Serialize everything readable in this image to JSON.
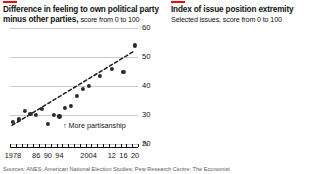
{
  "source": {
    "text": "Sources: ANES; American National Election Studies; Pew Research Centre; The Economist"
  },
  "left": {
    "title": "Difference in feeling to own political party",
    "title_line2": "minus other parties,",
    "subtitle": "score from 0 to 100",
    "annotation": "↑ More partisanship",
    "break_symbol": "∿"
  },
  "right": {
    "title": "Index of issue position extremity",
    "subtitle": "Selected issues, score from 0 to 100",
    "annotation": "↑ More divided beliefs",
    "break_symbol": "∿"
  },
  "chart_data": [
    {
      "type": "scatter",
      "title": "Difference in feeling to own political party minus other parties",
      "subtitle": "score from 0 to 100",
      "xlabel": "",
      "ylabel": "score from 0 to 100",
      "ylim": [
        20,
        60
      ],
      "xlim": [
        1977,
        2021
      ],
      "yticks": [
        20,
        30,
        40,
        50,
        60
      ],
      "xticks": [
        1978,
        1986,
        1990,
        1994,
        2004,
        2012,
        2016,
        2020
      ],
      "xticklabels": [
        "1978",
        "86",
        "90",
        "94",
        "2004",
        "12",
        "16",
        "20"
      ],
      "grid": true,
      "legend": "none",
      "annotation": "↑ More partisanship",
      "x": [
        1978,
        1980,
        1982,
        1984,
        1986,
        1988,
        1990,
        1992,
        1994,
        1996,
        1998,
        2000,
        2002,
        2004,
        2008,
        2012,
        2016,
        2020
      ],
      "values": [
        27.5,
        28.5,
        31.5,
        30.5,
        30.0,
        32.0,
        27.0,
        30.0,
        29.5,
        32.5,
        33.0,
        36.5,
        39.0,
        40.0,
        43.5,
        46.0,
        45.0,
        54.0
      ],
      "trendline": {
        "type": "dashed",
        "x": [
          1978,
          2020
        ],
        "y": [
          26.5,
          52.0
        ]
      }
    },
    {
      "type": "line",
      "title": "Index of issue position extremity",
      "subtitle": "Selected issues, score from 0 to 100",
      "xlabel": "",
      "ylabel": "score from 0 to 100",
      "ylim": [
        20,
        60
      ],
      "xlim": [
        1982,
        2017
      ],
      "yticks": [
        20,
        30,
        40,
        50,
        60
      ],
      "xticks": [
        1982,
        1986,
        1990,
        1994,
        2000,
        2004,
        2008,
        2012,
        2016
      ],
      "xticklabels": [
        "1982",
        "86",
        "90",
        "94",
        "2000",
        "04",
        "08",
        "12",
        "16"
      ],
      "grid": true,
      "legend": "inline-labels",
      "annotation": "↑ More divided beliefs",
      "x": [
        1982,
        1984,
        1986,
        1988,
        1990,
        1992,
        1994,
        1996,
        1998,
        2000,
        2002,
        2004,
        2006,
        2008,
        2010,
        2012,
        2014,
        2016
      ],
      "series": [
        {
          "name": "Government health care",
          "color": "#8C9398",
          "label_pos": "top-center",
          "values": [
            null,
            null,
            51.5,
            53.5,
            54.0,
            54.5,
            54.5,
            47.0,
            46.5,
            47.0,
            47.5,
            48.0,
            53.5,
            57.5,
            55.5,
            57.5,
            55.5,
            59.0
          ]
        },
        {
          "name": "Aid to black Americans",
          "color": "#2B2B2B",
          "label_pos": "bottom-left",
          "values": [
            41.0,
            40.0,
            40.5,
            39.0,
            41.0,
            40.5,
            47.5,
            47.5,
            48.0,
            47.5,
            47.5,
            47.5,
            48.0,
            53.0,
            51.5,
            51.5,
            51.0,
            51.0
          ]
        },
        {
          "name": "Defence spending",
          "color": "#5E6468",
          "label_pos": "bottom-center",
          "values": [
            40.5,
            38.5,
            39.0,
            38.0,
            39.5,
            38.5,
            38.5,
            38.5,
            39.0,
            39.5,
            40.5,
            41.0,
            41.0,
            43.0,
            42.0,
            41.0,
            40.5,
            42.0
          ]
        },
        {
          "name": "Government spending",
          "color": "#2B2B2B",
          "label_pos": "bottom-right",
          "values": [
            41.0,
            39.0,
            40.5,
            38.5,
            41.0,
            38.5,
            41.0,
            38.5,
            40.5,
            39.0,
            40.0,
            41.5,
            43.0,
            45.5,
            43.0,
            40.5,
            41.0,
            42.5
          ]
        }
      ]
    }
  ]
}
